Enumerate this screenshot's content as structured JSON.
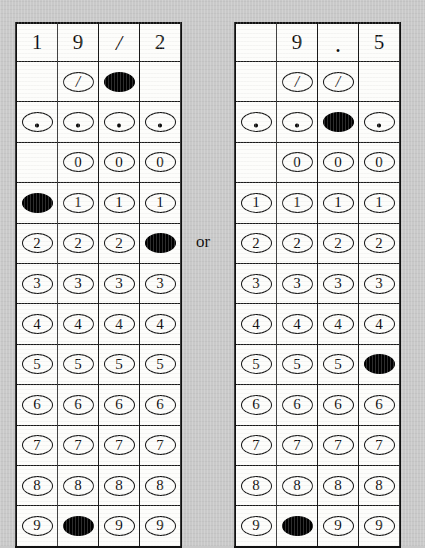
{
  "figure": {
    "kind": "grid-in-answer-sheets",
    "separator_label": "or",
    "background_color": "#c9c9c9",
    "grid_color": "#fdfdfb",
    "ink_color": "#111111"
  },
  "row_labels": [
    "fraction-slash",
    "decimal-point",
    "0",
    "1",
    "2",
    "3",
    "4",
    "5",
    "6",
    "7",
    "8",
    "9"
  ],
  "glyphs": {
    "fraction_slash": "/",
    "decimal_point": ".",
    "blank": ""
  },
  "grids": [
    {
      "name": "left-grid",
      "answer": "19/2",
      "columns": 4,
      "header": [
        "1",
        "9",
        "/",
        "2"
      ],
      "rows": [
        {
          "label": "fraction-slash",
          "glyph": "/",
          "cells": [
            {
              "present": false,
              "filled": false
            },
            {
              "present": true,
              "filled": false
            },
            {
              "present": true,
              "filled": true
            },
            {
              "present": false,
              "filled": false
            }
          ]
        },
        {
          "label": "decimal-point",
          "glyph": ".",
          "cells": [
            {
              "present": true,
              "filled": false
            },
            {
              "present": true,
              "filled": false
            },
            {
              "present": true,
              "filled": false
            },
            {
              "present": true,
              "filled": false
            }
          ]
        },
        {
          "label": "0",
          "glyph": "0",
          "cells": [
            {
              "present": false,
              "filled": false
            },
            {
              "present": true,
              "filled": false
            },
            {
              "present": true,
              "filled": false
            },
            {
              "present": true,
              "filled": false
            }
          ]
        },
        {
          "label": "1",
          "glyph": "1",
          "cells": [
            {
              "present": true,
              "filled": true
            },
            {
              "present": true,
              "filled": false
            },
            {
              "present": true,
              "filled": false
            },
            {
              "present": true,
              "filled": false
            }
          ]
        },
        {
          "label": "2",
          "glyph": "2",
          "cells": [
            {
              "present": true,
              "filled": false
            },
            {
              "present": true,
              "filled": false
            },
            {
              "present": true,
              "filled": false
            },
            {
              "present": true,
              "filled": true
            }
          ]
        },
        {
          "label": "3",
          "glyph": "3",
          "cells": [
            {
              "present": true,
              "filled": false
            },
            {
              "present": true,
              "filled": false
            },
            {
              "present": true,
              "filled": false
            },
            {
              "present": true,
              "filled": false
            }
          ]
        },
        {
          "label": "4",
          "glyph": "4",
          "cells": [
            {
              "present": true,
              "filled": false
            },
            {
              "present": true,
              "filled": false
            },
            {
              "present": true,
              "filled": false
            },
            {
              "present": true,
              "filled": false
            }
          ]
        },
        {
          "label": "5",
          "glyph": "5",
          "cells": [
            {
              "present": true,
              "filled": false
            },
            {
              "present": true,
              "filled": false
            },
            {
              "present": true,
              "filled": false
            },
            {
              "present": true,
              "filled": false
            }
          ]
        },
        {
          "label": "6",
          "glyph": "6",
          "cells": [
            {
              "present": true,
              "filled": false
            },
            {
              "present": true,
              "filled": false
            },
            {
              "present": true,
              "filled": false
            },
            {
              "present": true,
              "filled": false
            }
          ]
        },
        {
          "label": "7",
          "glyph": "7",
          "cells": [
            {
              "present": true,
              "filled": false
            },
            {
              "present": true,
              "filled": false
            },
            {
              "present": true,
              "filled": false
            },
            {
              "present": true,
              "filled": false
            }
          ]
        },
        {
          "label": "8",
          "glyph": "8",
          "cells": [
            {
              "present": true,
              "filled": false
            },
            {
              "present": true,
              "filled": false
            },
            {
              "present": true,
              "filled": false
            },
            {
              "present": true,
              "filled": false
            }
          ]
        },
        {
          "label": "9",
          "glyph": "9",
          "cells": [
            {
              "present": true,
              "filled": false
            },
            {
              "present": true,
              "filled": true
            },
            {
              "present": true,
              "filled": false
            },
            {
              "present": true,
              "filled": false
            }
          ]
        }
      ]
    },
    {
      "name": "right-grid",
      "answer": "9.5",
      "columns": 4,
      "header": [
        "",
        "9",
        ".",
        "5"
      ],
      "rows": [
        {
          "label": "fraction-slash",
          "glyph": "/",
          "cells": [
            {
              "present": false,
              "filled": false
            },
            {
              "present": true,
              "filled": false
            },
            {
              "present": true,
              "filled": false
            },
            {
              "present": false,
              "filled": false
            }
          ]
        },
        {
          "label": "decimal-point",
          "glyph": ".",
          "cells": [
            {
              "present": true,
              "filled": false
            },
            {
              "present": true,
              "filled": false
            },
            {
              "present": true,
              "filled": true
            },
            {
              "present": true,
              "filled": false
            }
          ]
        },
        {
          "label": "0",
          "glyph": "0",
          "cells": [
            {
              "present": false,
              "filled": false
            },
            {
              "present": true,
              "filled": false
            },
            {
              "present": true,
              "filled": false
            },
            {
              "present": true,
              "filled": false
            }
          ]
        },
        {
          "label": "1",
          "glyph": "1",
          "cells": [
            {
              "present": true,
              "filled": false
            },
            {
              "present": true,
              "filled": false
            },
            {
              "present": true,
              "filled": false
            },
            {
              "present": true,
              "filled": false
            }
          ]
        },
        {
          "label": "2",
          "glyph": "2",
          "cells": [
            {
              "present": true,
              "filled": false
            },
            {
              "present": true,
              "filled": false
            },
            {
              "present": true,
              "filled": false
            },
            {
              "present": true,
              "filled": false
            }
          ]
        },
        {
          "label": "3",
          "glyph": "3",
          "cells": [
            {
              "present": true,
              "filled": false
            },
            {
              "present": true,
              "filled": false
            },
            {
              "present": true,
              "filled": false
            },
            {
              "present": true,
              "filled": false
            }
          ]
        },
        {
          "label": "4",
          "glyph": "4",
          "cells": [
            {
              "present": true,
              "filled": false
            },
            {
              "present": true,
              "filled": false
            },
            {
              "present": true,
              "filled": false
            },
            {
              "present": true,
              "filled": false
            }
          ]
        },
        {
          "label": "5",
          "glyph": "5",
          "cells": [
            {
              "present": true,
              "filled": false
            },
            {
              "present": true,
              "filled": false
            },
            {
              "present": true,
              "filled": false
            },
            {
              "present": true,
              "filled": true
            }
          ]
        },
        {
          "label": "6",
          "glyph": "6",
          "cells": [
            {
              "present": true,
              "filled": false
            },
            {
              "present": true,
              "filled": false
            },
            {
              "present": true,
              "filled": false
            },
            {
              "present": true,
              "filled": false
            }
          ]
        },
        {
          "label": "7",
          "glyph": "7",
          "cells": [
            {
              "present": true,
              "filled": false
            },
            {
              "present": true,
              "filled": false
            },
            {
              "present": true,
              "filled": false
            },
            {
              "present": true,
              "filled": false
            }
          ]
        },
        {
          "label": "8",
          "glyph": "8",
          "cells": [
            {
              "present": true,
              "filled": false
            },
            {
              "present": true,
              "filled": false
            },
            {
              "present": true,
              "filled": false
            },
            {
              "present": true,
              "filled": false
            }
          ]
        },
        {
          "label": "9",
          "glyph": "9",
          "cells": [
            {
              "present": true,
              "filled": false
            },
            {
              "present": true,
              "filled": true
            },
            {
              "present": true,
              "filled": false
            },
            {
              "present": true,
              "filled": false
            }
          ]
        }
      ]
    }
  ]
}
